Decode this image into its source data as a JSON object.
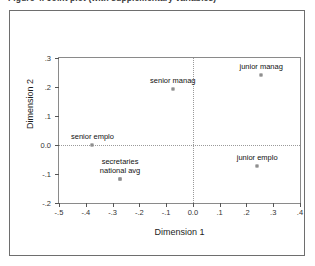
{
  "chart_title": "Figure 4. Joint plot (with supplementary variables)",
  "chart_data": {
    "type": "scatter",
    "title": "Figure 4. Joint plot (with supplementary variables)",
    "xlabel": "Dimension 1",
    "ylabel": "Dimension 2",
    "xlim": [
      -0.5,
      0.4
    ],
    "ylim": [
      -0.2,
      0.3
    ],
    "xticks": [
      "-.5",
      "-.4",
      "-.3",
      "-.2",
      "-.1",
      "0.0",
      ".1",
      ".2",
      ".3",
      ".4"
    ],
    "xtick_values": [
      -0.5,
      -0.4,
      -0.3,
      -0.2,
      -0.1,
      0.0,
      0.1,
      0.2,
      0.3,
      0.4
    ],
    "yticks": [
      "-.2",
      "-.1",
      "0.0",
      ".1",
      ".2",
      ".3"
    ],
    "ytick_values": [
      -0.2,
      -0.1,
      0.0,
      0.1,
      0.2,
      0.3
    ],
    "grid": false,
    "reference_lines": {
      "x": 0.0,
      "y": 0.0,
      "style": "dotted"
    },
    "legend": "none",
    "marker": "open-square",
    "points": [
      {
        "label": "junior manag",
        "x": 0.255,
        "y": 0.242
      },
      {
        "label": "senior manag",
        "x": -0.075,
        "y": 0.192
      },
      {
        "label": "senior emplo",
        "x": -0.375,
        "y": 0.0
      },
      {
        "label": "junior emplo",
        "x": 0.24,
        "y": -0.072
      },
      {
        "label": "secretaries",
        "x": -0.272,
        "y": -0.118
      },
      {
        "label": "national avg",
        "x": -0.272,
        "y": -0.118
      }
    ]
  },
  "axis": {
    "x_title": "Dimension 1",
    "y_title": "Dimension 2"
  }
}
